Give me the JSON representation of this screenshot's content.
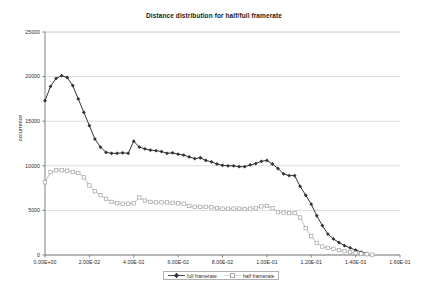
{
  "chart_data": {
    "type": "line",
    "title": "Distance distribution for half/full framerate",
    "xlabel": "",
    "ylabel": "occurrence",
    "xlim": [
      0.0,
      0.16
    ],
    "ylim": [
      0,
      25000
    ],
    "grid": true,
    "grid_axis": "y",
    "legend_position": "bottom",
    "x_tick_labels": [
      "0.00E+00",
      "2.00E-02",
      "4.00E-02",
      "6.00E-02",
      "8.00E-02",
      "1.00E-01",
      "1.20E-01",
      "1.40E-01",
      "1.60E-01"
    ],
    "x_ticks": [
      0.0,
      0.02,
      0.04,
      0.06,
      0.08,
      0.1,
      0.12,
      0.14,
      0.16
    ],
    "y_tick_labels": [
      "0",
      "5000",
      "10000",
      "15000",
      "20000",
      "25000"
    ],
    "y_ticks": [
      0,
      5000,
      10000,
      15000,
      20000,
      25000
    ],
    "series": [
      {
        "name": "full framerate",
        "color": "#333333",
        "marker": "filled-diamond",
        "x": [
          0.0,
          0.0025,
          0.005,
          0.0075,
          0.01,
          0.0125,
          0.015,
          0.0175,
          0.02,
          0.0225,
          0.025,
          0.0275,
          0.03,
          0.0325,
          0.035,
          0.0375,
          0.04,
          0.0425,
          0.045,
          0.0475,
          0.05,
          0.0525,
          0.055,
          0.0575,
          0.06,
          0.0625,
          0.065,
          0.0675,
          0.07,
          0.0725,
          0.075,
          0.0775,
          0.08,
          0.0825,
          0.085,
          0.0875,
          0.09,
          0.0925,
          0.095,
          0.0975,
          0.1,
          0.1025,
          0.105,
          0.1075,
          0.11,
          0.1125,
          0.115,
          0.1175,
          0.12,
          0.1225,
          0.125,
          0.1275,
          0.13,
          0.1325,
          0.135,
          0.1375,
          0.14,
          0.1425,
          0.145
        ],
        "values": [
          17300,
          18900,
          19800,
          20100,
          19900,
          19000,
          17500,
          16000,
          14500,
          13000,
          12100,
          11500,
          11400,
          11400,
          11450,
          11400,
          12750,
          12100,
          11900,
          11750,
          11700,
          11600,
          11400,
          11450,
          11300,
          11200,
          11000,
          10800,
          10900,
          10600,
          10450,
          10200,
          10050,
          10000,
          10000,
          9900,
          9900,
          10100,
          10250,
          10500,
          10600,
          10200,
          9700,
          9100,
          8900,
          8900,
          7700,
          6700,
          5700,
          4400,
          3300,
          2350,
          1800,
          1400,
          1050,
          800,
          550,
          330,
          180
        ]
      },
      {
        "name": "half framerate",
        "color": "#b5b5b5",
        "marker": "open-square",
        "x": [
          0.0,
          0.0025,
          0.005,
          0.0075,
          0.01,
          0.0125,
          0.015,
          0.0175,
          0.02,
          0.0225,
          0.025,
          0.0275,
          0.03,
          0.0325,
          0.035,
          0.0375,
          0.04,
          0.0425,
          0.045,
          0.0475,
          0.05,
          0.0525,
          0.055,
          0.0575,
          0.06,
          0.0625,
          0.065,
          0.0675,
          0.07,
          0.0725,
          0.075,
          0.0775,
          0.08,
          0.0825,
          0.085,
          0.0875,
          0.09,
          0.0925,
          0.095,
          0.0975,
          0.1,
          0.1025,
          0.105,
          0.1075,
          0.11,
          0.1125,
          0.115,
          0.1175,
          0.12,
          0.1225,
          0.125,
          0.1275,
          0.13,
          0.1325,
          0.135,
          0.1375,
          0.14,
          0.1425,
          0.145,
          0.1475
        ],
        "values": [
          8150,
          9300,
          9500,
          9500,
          9450,
          9300,
          9200,
          8700,
          7800,
          7150,
          6700,
          6300,
          5950,
          5800,
          5750,
          5750,
          5800,
          6450,
          6100,
          5950,
          5900,
          5900,
          5900,
          5850,
          5800,
          5750,
          5500,
          5400,
          5400,
          5400,
          5350,
          5250,
          5200,
          5200,
          5200,
          5200,
          5150,
          5200,
          5250,
          5450,
          5500,
          5250,
          4800,
          4750,
          4700,
          4700,
          4200,
          3000,
          2100,
          1350,
          950,
          800,
          700,
          550,
          420,
          320,
          220,
          150,
          90,
          40
        ]
      }
    ]
  },
  "legend": {
    "items": [
      {
        "label": "full framerate"
      },
      {
        "label": "half framerate"
      }
    ]
  }
}
